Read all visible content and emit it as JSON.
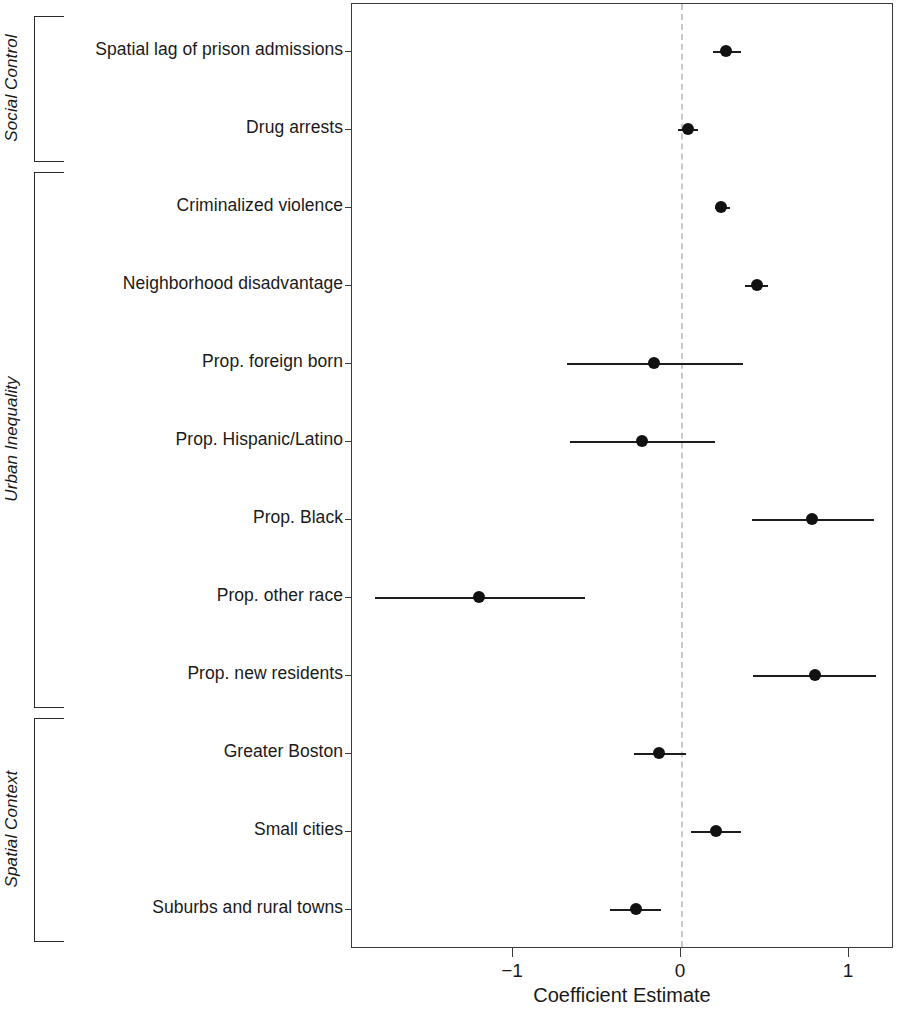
{
  "figure": {
    "x_axis_title": "Coefficient Estimate",
    "panel": {
      "x_min": -1.96,
      "x_max": 1.27
    }
  },
  "groups": [
    {
      "name": "Social Control",
      "label": "Social Control",
      "row_start": 0,
      "row_end": 1
    },
    {
      "name": "Urban Inequality",
      "label": "Urban Inequality",
      "row_start": 2,
      "row_end": 8
    },
    {
      "name": "Spatial Context",
      "label": "Spatial Context",
      "row_start": 9,
      "row_end": 11
    }
  ],
  "axis": {
    "ticks": [
      {
        "value": -1,
        "label": "−1"
      },
      {
        "value": 0,
        "label": "0"
      },
      {
        "value": 1,
        "label": "1"
      }
    ],
    "reference_line": {
      "value": 0,
      "style": "dashed",
      "color": "#c9c9c9"
    }
  },
  "chart_data": {
    "type": "scatter",
    "subtype": "coefficient-plot",
    "title": "",
    "xlabel": "Coefficient Estimate",
    "ylabel": "",
    "xlim": [
      -1.96,
      1.27
    ],
    "grid": false,
    "legend": null,
    "reference_line_x": 0,
    "categories": [
      "Spatial lag of prison admissions",
      "Drug arrests",
      "Criminalized violence",
      "Neighborhood disadvantage",
      "Prop. foreign born",
      "Prop. Hispanic/Latino",
      "Prop. Black",
      "Prop. other race",
      "Prop. new residents",
      "Greater Boston",
      "Small cities",
      "Suburbs and rural towns"
    ],
    "values": [
      0.27,
      0.04,
      0.24,
      0.45,
      -0.16,
      -0.23,
      0.78,
      -1.2,
      0.8,
      -0.13,
      0.21,
      -0.27
    ],
    "ci_low": [
      0.19,
      -0.02,
      0.2,
      0.38,
      -0.68,
      -0.66,
      0.42,
      -1.82,
      0.43,
      -0.28,
      0.06,
      -0.42
    ],
    "ci_high": [
      0.36,
      0.1,
      0.29,
      0.52,
      0.37,
      0.2,
      1.15,
      -0.57,
      1.16,
      0.03,
      0.36,
      -0.12
    ],
    "groups": [
      "Social Control",
      "Social Control",
      "Urban Inequality",
      "Urban Inequality",
      "Urban Inequality",
      "Urban Inequality",
      "Urban Inequality",
      "Urban Inequality",
      "Urban Inequality",
      "Spatial Context",
      "Spatial Context",
      "Spatial Context"
    ]
  }
}
